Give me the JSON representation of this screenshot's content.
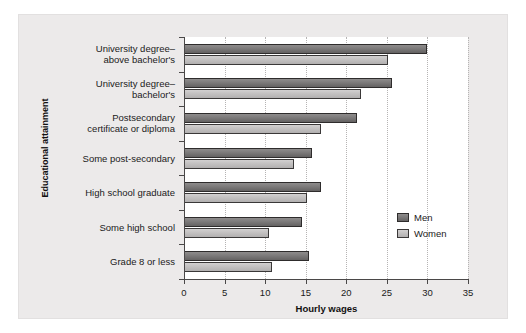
{
  "chart_data": {
    "type": "bar",
    "orientation": "horizontal",
    "title": "",
    "xlabel": "Hourly wages",
    "ylabel": "Educational attainment",
    "xlim": [
      0,
      35
    ],
    "xticks": [
      0,
      5,
      10,
      15,
      20,
      25,
      30,
      35
    ],
    "xtick_labels": [
      "0",
      "5",
      "10",
      "15",
      "20",
      "25",
      "30",
      "35"
    ],
    "grid": "vertical-dotted",
    "legend_position": "inside-right-lower",
    "categories": [
      "University degree–\nabove bachelor's",
      "University degree–\nbachelor's",
      "Postsecondary\ncertificate or diploma",
      "Some post-secondary",
      "High school graduate",
      "Some high school",
      "Grade 8 or less"
    ],
    "series": [
      {
        "name": "Men",
        "color": "#7c7a7a",
        "values": [
          30.0,
          25.6,
          21.3,
          15.8,
          16.9,
          14.5,
          15.4
        ]
      },
      {
        "name": "Women",
        "color": "#c3c1c1",
        "values": [
          25.1,
          21.8,
          16.9,
          13.5,
          15.2,
          10.5,
          10.9
        ]
      }
    ]
  },
  "legend": {
    "entries": [
      {
        "label": "Men"
      },
      {
        "label": "Women"
      }
    ]
  }
}
